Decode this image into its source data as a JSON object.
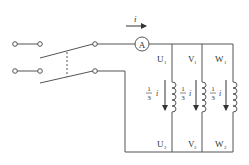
{
  "diagram": {
    "type": "circuit",
    "current_label": "i",
    "ammeter_label": "A",
    "branch_current_label": "1/3 i",
    "fraction": {
      "num": "1",
      "den": "3",
      "var": "i"
    },
    "phases": [
      {
        "name": "U",
        "top": "U",
        "top_sub": "1",
        "bottom": "U",
        "bottom_sub": "2"
      },
      {
        "name": "V",
        "top": "V",
        "top_sub": "1",
        "bottom": "V",
        "bottom_sub": "2"
      },
      {
        "name": "W",
        "top": "W",
        "top_sub": "1",
        "bottom": "W",
        "bottom_sub": "2"
      }
    ],
    "colors": {
      "line": "#555555",
      "text": "#333333",
      "background": "#ffffff"
    }
  }
}
